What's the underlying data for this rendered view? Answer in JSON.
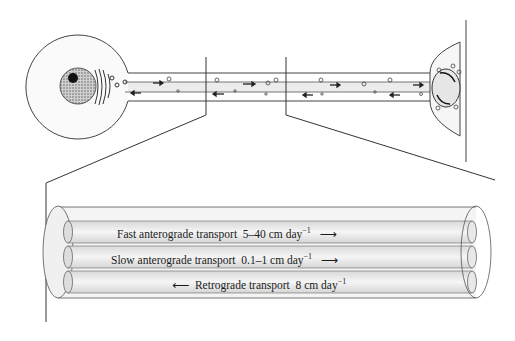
{
  "diagram": {
    "top_panel": {
      "parts": [
        "cell-body",
        "nucleus",
        "golgi",
        "axon",
        "axon-terminal",
        "target-membrane"
      ]
    },
    "tubes": [
      {
        "label": "Fast anterograde transport",
        "rate": "5–40 cm day",
        "exp": "−1",
        "direction": "right",
        "arrow": "⟶"
      },
      {
        "label": "Slow anterograde transport",
        "rate": "0.1–1 cm day",
        "exp": "−1",
        "direction": "right",
        "arrow": "⟶"
      },
      {
        "label": "Retrograde transport",
        "rate": "8 cm day",
        "exp": "−1",
        "direction": "left",
        "arrow": "⟵"
      }
    ],
    "colors": {
      "line": "#3a3a3a",
      "fill": "#e8e8e8",
      "nucleus": "#9a9a9a",
      "nucleolus": "#111111"
    }
  }
}
